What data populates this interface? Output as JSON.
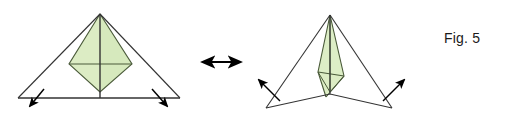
{
  "figure": {
    "caption": "Fig. 5",
    "colors": {
      "stroke": "#333333",
      "fill_green": "#dcecc4",
      "fill_green_dark": "#cfe3b4",
      "background": "#ffffff",
      "text": "#1a1a1a",
      "arrow": "#000000"
    },
    "panels": [
      {
        "name": "flat-state",
        "description": "Flat kite outline with shaded inner diamond and two outward base arrows",
        "outer_outline": "18,98 100,14 180,98",
        "base_line": "18,98 180,98",
        "center_fold": "100,14 100,98",
        "green_polygon": "100,14 132,64 100,92 69,64",
        "green_upper_left": "100,14 69,64 100,64",
        "green_upper_right": "100,14 132,64 100,64",
        "green_mid_line": "69,64 132,64",
        "arrows": [
          {
            "name": "base-arrow-left",
            "from": "42,90",
            "to": "30,105"
          },
          {
            "name": "base-arrow-right",
            "from": "153,90",
            "to": "166,105"
          }
        ]
      },
      {
        "name": "folded-state",
        "description": "Three dimensional folded kite with raised center spine and two outward arrows",
        "outer_outline": "266,108 330,15 392,108",
        "base_line": "266,108 330,94 392,108",
        "green_polygon": "330,15 344,76 326,97 318,72",
        "green_spine": "330,15 330,92",
        "green_left_fold": "330,15 318,72 326,97",
        "green_mid_line": "318,72 344,76",
        "inner_lines": [
          "330,15 318,72",
          "330,15 344,76",
          "318,72 330,92",
          "344,76 330,92",
          "326,97 330,94"
        ],
        "arrows": [
          {
            "name": "base-arrow-left",
            "from": "278,100",
            "to": "259,80"
          },
          {
            "name": "base-arrow-right",
            "from": "384,100",
            "to": "404,80"
          }
        ]
      }
    ],
    "transform_arrow": {
      "name": "bidirectional-transform-arrow",
      "label": "double-headed horizontal arrow",
      "from_x": 199,
      "to_x": 244,
      "y": 62
    }
  }
}
